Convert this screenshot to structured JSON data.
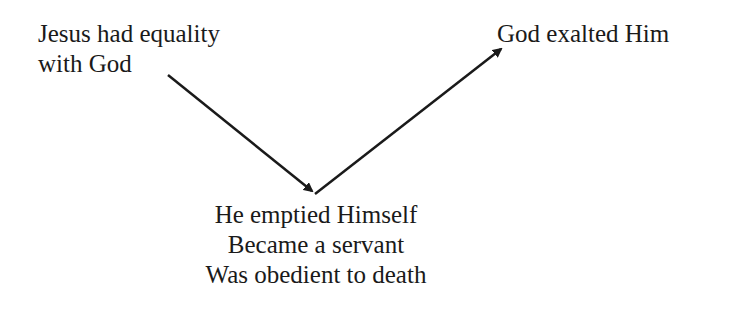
{
  "diagram": {
    "start_node": {
      "lines": [
        "Jesus had equality",
        "with God"
      ]
    },
    "bottom_node": {
      "lines": [
        "He emptied Himself",
        "Became a servant",
        "Was obedient to death"
      ]
    },
    "end_node": {
      "lines": [
        "God exalted Him"
      ]
    },
    "arrows": [
      {
        "from": "start_node",
        "to": "bottom_node",
        "direction": "down-right"
      },
      {
        "from": "bottom_node",
        "to": "end_node",
        "direction": "up-right"
      }
    ],
    "colors": {
      "text": "#1a1a1a",
      "arrow": "#1a1a1a",
      "background": "#ffffff"
    }
  }
}
